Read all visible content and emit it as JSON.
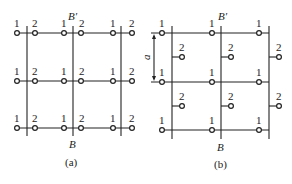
{
  "figure": {
    "panel_a": {
      "caption": "(a)",
      "top_label": "B′",
      "bottom_label": "B",
      "rows": [
        {
          "y": 33,
          "nodes": [
            "1",
            "2",
            "1",
            "2",
            "1",
            "2"
          ]
        },
        {
          "y": 81,
          "nodes": [
            "1",
            "2",
            "1",
            "2",
            "1",
            "2"
          ]
        },
        {
          "y": 128,
          "nodes": [
            "1",
            "2",
            "1",
            "2",
            "1",
            "2"
          ]
        }
      ],
      "node_x": [
        17,
        35,
        64,
        81,
        113,
        132
      ],
      "vertical_lines_x": [
        27,
        73,
        121
      ]
    },
    "panel_b": {
      "caption": "(b)",
      "top_label": "B′",
      "bottom_label": "B",
      "dimension_label": "a",
      "rows_y": [
        33,
        82,
        130
      ],
      "site1_label": "1",
      "site2_label": "2",
      "site1_x": [
        162,
        212,
        259
      ],
      "site2_x": [
        182,
        231,
        279
      ],
      "site2_y": [
        57,
        106
      ],
      "vertical_lines_x": [
        172,
        221,
        269
      ]
    }
  }
}
